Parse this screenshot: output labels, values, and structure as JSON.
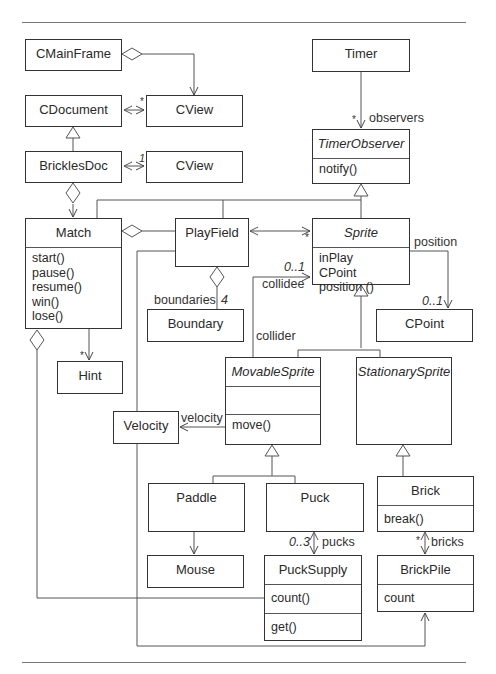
{
  "classes": {
    "cmainframe": {
      "name": "CMainFrame"
    },
    "cdocument": {
      "name": "CDocument"
    },
    "cview1": {
      "name": "CView"
    },
    "bricklesdoc": {
      "name": "BricklesDoc"
    },
    "cview2": {
      "name": "CView"
    },
    "timer": {
      "name": "Timer"
    },
    "timerobserver": {
      "name": "TimerObserver",
      "operations": [
        "notify()"
      ]
    },
    "match": {
      "name": "Match",
      "operations": [
        "start()",
        "pause()",
        "resume()",
        "win()",
        "lose()"
      ]
    },
    "playfield": {
      "name": "PlayField"
    },
    "sprite": {
      "name": "Sprite",
      "members": [
        "inPlay",
        "CPoint position ()"
      ]
    },
    "boundary": {
      "name": "Boundary"
    },
    "cpoint": {
      "name": "CPoint"
    },
    "hint": {
      "name": "Hint"
    },
    "movablesprite": {
      "name": "MovableSprite",
      "operations": [
        "move()"
      ]
    },
    "stationarysprite": {
      "name": "StationarySprite"
    },
    "velocity": {
      "name": "Velocity"
    },
    "paddle": {
      "name": "Paddle"
    },
    "mouse": {
      "name": "Mouse"
    },
    "puck": {
      "name": "Puck"
    },
    "pucksupply": {
      "name": "PuckSupply",
      "attributes": [
        "count()"
      ],
      "operations": [
        "get()"
      ]
    },
    "brick": {
      "name": "Brick",
      "operations": [
        "break()"
      ]
    },
    "brickpile": {
      "name": "BrickPile",
      "attributes": [
        "count"
      ]
    }
  },
  "labels": {
    "cdoc_cview_mult": "*",
    "bdoc_cview_mult": "1",
    "timer_mult": "*",
    "observers": "observers",
    "playfield_sprite_mult": "*",
    "collidee_mult": "0..1",
    "collidee": "collidee",
    "collider": "collider",
    "position": "position",
    "cpoint_mult": "0..1",
    "boundaries": "boundaries",
    "boundaries_mult": "4",
    "hint_mult": "*",
    "velocity": "velocity",
    "pucks_mult": "0..3",
    "pucks": "pucks",
    "bricks_mult": "*",
    "bricks": "bricks"
  }
}
